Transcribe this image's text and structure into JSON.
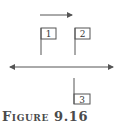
{
  "figure": {
    "caption": "Figure 9.16",
    "direction_arrow": {
      "direction": "right",
      "x1": 40,
      "x2": 72,
      "y": 15
    },
    "axis_line": {
      "type": "double-arrow",
      "x1": 9,
      "x2": 114,
      "y": 67
    },
    "flags": [
      {
        "label": "1",
        "pole_x": 41,
        "pole_top": 28,
        "pole_bottom": 55,
        "box": {
          "x": 41,
          "y": 28,
          "w": 15,
          "h": 11
        },
        "position": "above"
      },
      {
        "label": "2",
        "pole_x": 75,
        "pole_top": 28,
        "pole_bottom": 55,
        "box": {
          "x": 75,
          "y": 28,
          "w": 15,
          "h": 11
        },
        "position": "above"
      },
      {
        "label": "3",
        "pole_x": 74,
        "pole_top": 78,
        "pole_bottom": 104,
        "box": {
          "x": 74,
          "y": 94,
          "w": 16,
          "h": 10
        },
        "position": "below"
      }
    ],
    "colors": {
      "line": "#555555",
      "text": "#4a4a4a"
    }
  }
}
